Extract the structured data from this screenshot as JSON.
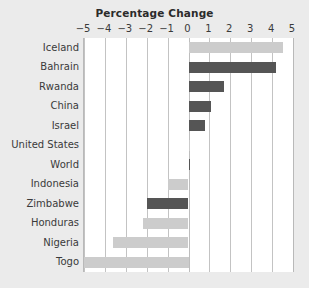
{
  "chart_data": {
    "type": "bar",
    "orientation": "horizontal",
    "title": "Percentage Change",
    "xlabel": "",
    "ylabel": "",
    "xlim": [
      -5,
      5
    ],
    "xticks": [
      "−5",
      "−4",
      "−3",
      "−2",
      "−1",
      "0",
      "1",
      "2",
      "3",
      "4",
      "5"
    ],
    "xtick_values": [
      -5,
      -4,
      -3,
      -2,
      -1,
      0,
      1,
      2,
      3,
      4,
      5
    ],
    "grid": "vertical",
    "legend": "none",
    "categories": [
      "Iceland",
      "Bahrain",
      "Rwanda",
      "China",
      "Israel",
      "United States",
      "World",
      "Indonesia",
      "Zimbabwe",
      "Honduras",
      "Nigeria",
      "Togo"
    ],
    "values": [
      4.5,
      4.2,
      1.7,
      1.1,
      0.8,
      0.05,
      0.05,
      -1.0,
      -2.0,
      -2.2,
      -3.6,
      -5.4
    ],
    "bar_colors": [
      "light",
      "dark",
      "dark",
      "dark",
      "dark",
      "light",
      "dark",
      "light",
      "dark",
      "light",
      "light",
      "light"
    ],
    "colors": {
      "light": "#cccccc",
      "dark": "#555555",
      "background": "#ebebeb",
      "plot_background": "#ffffff",
      "gridline": "#c3c3c3",
      "text": "#3a3a3a",
      "title": "#2b2b2b"
    }
  }
}
